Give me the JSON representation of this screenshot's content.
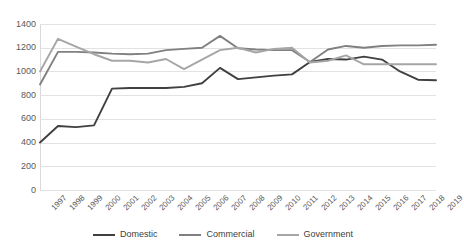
{
  "chart_data": {
    "type": "line",
    "title": "",
    "subtitle": "",
    "xlabel": "",
    "ylabel": "",
    "grid": true,
    "legend_position": "bottom",
    "ylim": [
      0,
      1400
    ],
    "yticks": [
      0,
      200,
      400,
      600,
      800,
      1000,
      1200,
      1400
    ],
    "ytick_labels": [
      "0",
      "200",
      "400",
      "600",
      "800",
      "1000",
      "1200",
      "1400"
    ],
    "categories": [
      "1997",
      "1998",
      "1999",
      "2000",
      "2001",
      "2002",
      "2003",
      "2004",
      "2005",
      "2006",
      "2007",
      "2008",
      "2009",
      "2010",
      "2011",
      "2012",
      "2013",
      "2014",
      "2015",
      "2016",
      "2017",
      "2018",
      "2019"
    ],
    "series": [
      {
        "name": "Domestic",
        "color": "#404040",
        "values": [
          400,
          540,
          530,
          545,
          855,
          860,
          860,
          860,
          870,
          900,
          1030,
          935,
          950,
          965,
          975,
          1080,
          1105,
          1100,
          1125,
          1100,
          1000,
          930,
          925
        ]
      },
      {
        "name": "Commercial",
        "color": "#808080",
        "values": [
          890,
          1165,
          1165,
          1160,
          1150,
          1145,
          1150,
          1180,
          1190,
          1200,
          1300,
          1195,
          1185,
          1180,
          1180,
          1080,
          1185,
          1215,
          1200,
          1215,
          1220,
          1220,
          1225
        ]
      },
      {
        "name": "Government",
        "color": "#a6a6a6",
        "values": [
          1000,
          1275,
          1210,
          1145,
          1090,
          1090,
          1075,
          1105,
          1020,
          1100,
          1180,
          1200,
          1160,
          1190,
          1200,
          1075,
          1090,
          1135,
          1060,
          1060,
          1060,
          1060,
          1060
        ]
      }
    ]
  },
  "legend": {
    "items": [
      {
        "label": "Domestic",
        "color": "#404040"
      },
      {
        "label": "Commercial",
        "color": "#808080"
      },
      {
        "label": "Government",
        "color": "#a6a6a6"
      }
    ]
  }
}
